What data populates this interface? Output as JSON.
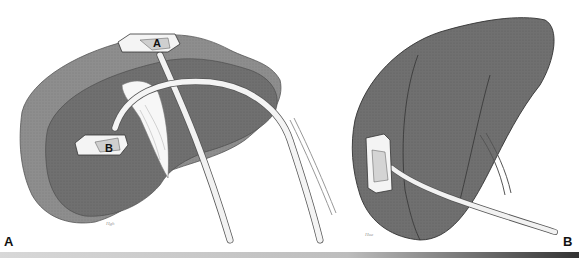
{
  "figure": {
    "panels": [
      {
        "id": "A",
        "label": "A",
        "probes": [
          {
            "label": "A"
          },
          {
            "label": "B"
          }
        ]
      },
      {
        "id": "B",
        "label": "B"
      }
    ]
  },
  "colors": {
    "background": "#ffffff",
    "liver_dark": "#6e6e6e",
    "liver_light": "#8c8c8c",
    "probe": "#f2f2f2",
    "outline": "#333333"
  }
}
